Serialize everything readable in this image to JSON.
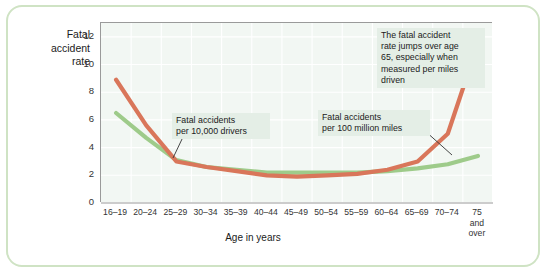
{
  "chart_data": {
    "type": "line",
    "title": "",
    "xlabel": "Age in years",
    "ylabel": "Fatal accident rate",
    "ylim": [
      0,
      13
    ],
    "yticks": [
      0,
      2,
      4,
      6,
      8,
      10,
      12
    ],
    "grid": true,
    "legend_position": "inline-annotations",
    "categories": [
      "16–19",
      "20–24",
      "25–29",
      "30–34",
      "35–39",
      "40–44",
      "45–49",
      "50–54",
      "55–59",
      "60–64",
      "65–69",
      "70–74",
      "75 and over"
    ],
    "categories_display": [
      "16–19",
      "20–24",
      "25–29",
      "30–34",
      "35–39",
      "40–44",
      "45–49",
      "50–54",
      "55–59",
      "60–64",
      "65–69",
      "70–74",
      "75|and|over"
    ],
    "series": [
      {
        "name": "Fatal accidents per 100 million miles",
        "color": "#d9765a",
        "values": [
          8.9,
          5.6,
          3.0,
          2.6,
          2.3,
          2.0,
          1.9,
          2.0,
          2.1,
          2.4,
          3.0,
          5.0,
          11.5
        ]
      },
      {
        "name": "Fatal accidents per 10,000 drivers",
        "color": "#9ecb8a",
        "values": [
          6.5,
          4.7,
          3.1,
          2.6,
          2.4,
          2.2,
          2.2,
          2.2,
          2.2,
          2.3,
          2.5,
          2.8,
          3.4
        ]
      }
    ],
    "annotations": [
      {
        "id": "drivers",
        "text": "Fatal accidents per 10,000 drivers",
        "lines": [
          "Fatal accidents",
          "per 10,000 drivers"
        ],
        "target_category": "30–34"
      },
      {
        "id": "miles",
        "text": "Fatal accidents per 100 million miles",
        "lines": [
          "Fatal accidents",
          "per 100 million miles"
        ],
        "target_category": "70–74"
      },
      {
        "id": "jump",
        "text": "The fatal accident rate jumps over age 65, especially when measured per miles driven",
        "lines": [
          "The fatal accident",
          "rate jumps over age",
          "65, especially when",
          "measured per miles",
          "driven"
        ],
        "target_category": "75 and over"
      }
    ],
    "colors": {
      "plot_background": "#f2f7f3",
      "grid": "#ffffff",
      "axis": "#9a9a9a",
      "frame": "#cfe3c4",
      "annotation_background": "#e4eee6",
      "orange_series": "#d9765a",
      "green_series": "#9ecb8a"
    }
  },
  "axis": {
    "ylabel_lines": [
      "Fatal",
      "accident",
      "rate"
    ],
    "xlabel": "Age in years"
  }
}
